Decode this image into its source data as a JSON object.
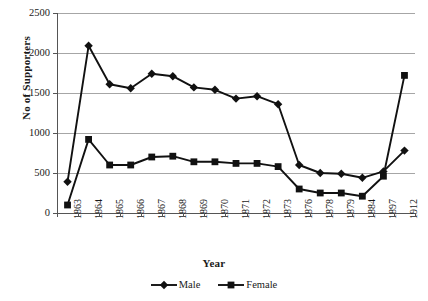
{
  "chart_data": {
    "type": "line",
    "title": "",
    "xlabel": "Year",
    "ylabel": "No of Supporters",
    "categories": [
      "1863",
      "1864",
      "1865",
      "1866",
      "1867",
      "1868",
      "1869",
      "1870",
      "1871",
      "1872",
      "1873",
      "1876",
      "1878",
      "1879",
      "1884",
      "1897",
      "1912"
    ],
    "ylim": [
      0,
      2500
    ],
    "yticks": [
      0,
      500,
      1000,
      1500,
      2000,
      2500
    ],
    "grid": true,
    "legend_position": "bottom",
    "series": [
      {
        "name": "Male",
        "marker": "diamond",
        "color": "#111111",
        "values": [
          390,
          2090,
          1610,
          1560,
          1740,
          1710,
          1570,
          1540,
          1430,
          1460,
          1360,
          600,
          500,
          490,
          440,
          520,
          780
        ]
      },
      {
        "name": "Female",
        "marker": "square",
        "color": "#111111",
        "values": [
          100,
          920,
          600,
          600,
          700,
          710,
          640,
          640,
          620,
          620,
          580,
          300,
          250,
          250,
          210,
          460,
          1720
        ]
      }
    ]
  },
  "legend": {
    "entries": [
      {
        "label": "Male"
      },
      {
        "label": "Female"
      }
    ]
  },
  "axes": {
    "y_title": "No of Supporters",
    "x_title": "Year"
  }
}
